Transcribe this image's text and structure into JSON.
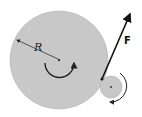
{
  "diagram": {
    "labels": {
      "radius": "R",
      "force": "F"
    },
    "large_wheel": {
      "cx": 59,
      "cy": 60,
      "r": 49,
      "fill": "#c8c8c8"
    },
    "small_wheel": {
      "cx": 111,
      "cy": 87,
      "r": 11,
      "fill": "#c8c8c8"
    },
    "force_vector": {
      "from": [
        102,
        79
      ],
      "to": [
        131,
        11
      ],
      "color": "#111111"
    },
    "large_rotation": "clockwise",
    "small_rotation": "counterclockwise"
  }
}
